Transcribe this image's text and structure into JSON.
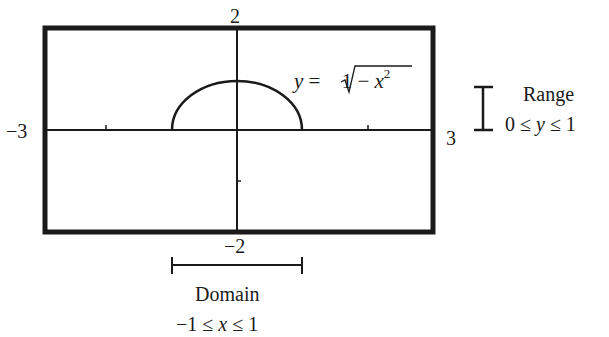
{
  "figure": {
    "window_labels": {
      "ymax": "2",
      "ymin": "−2",
      "xmin": "−3",
      "xmax": "3"
    },
    "function_label": {
      "lhs": "y",
      "eq": " = ",
      "radicand_prefix": "1 − ",
      "var": "x",
      "exp": "2"
    },
    "range": {
      "title": "Range",
      "expr_left": "0 ≤ ",
      "var": "y",
      "expr_right": " ≤ 1"
    },
    "domain": {
      "title": "Domain",
      "expr_left": "−1 ≤ ",
      "var": "x",
      "expr_right": " ≤ 1"
    },
    "colors": {
      "ink": "#1a1a1a",
      "background": "#ffffff"
    }
  }
}
